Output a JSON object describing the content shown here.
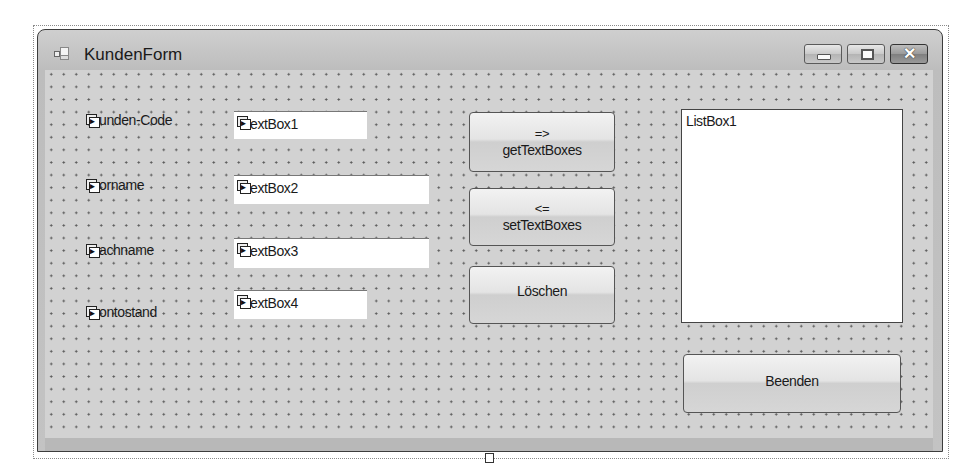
{
  "window": {
    "title": "KundenForm",
    "icon": "form-icon",
    "caption_buttons": [
      {
        "name": "minimize",
        "icon": "minimize-icon"
      },
      {
        "name": "maximize",
        "icon": "maximize-icon",
        "glyph": "□"
      },
      {
        "name": "close",
        "icon": "close-icon",
        "glyph": "✕"
      }
    ]
  },
  "labels": [
    {
      "text": "unden-Code",
      "full": "Kunden-Code"
    },
    {
      "text": "orname",
      "full": "Vorname"
    },
    {
      "text": "achname",
      "full": "Nachname"
    },
    {
      "text": "ontostand",
      "full": "Kontostand"
    }
  ],
  "textboxes": [
    {
      "text": "extBox1",
      "full": "TextBox1"
    },
    {
      "text": "extBox2",
      "full": "TextBox2"
    },
    {
      "text": "extBox3",
      "full": "TextBox3"
    },
    {
      "text": "extBox4",
      "full": "TextBox4"
    }
  ],
  "buttons": {
    "get": {
      "line1": "=>",
      "line2": "getTextBoxes"
    },
    "set": {
      "line1": "<=",
      "line2": "setTextBoxes"
    },
    "clear": {
      "label": "Löschen"
    },
    "exit": {
      "label": "Beenden"
    }
  },
  "listbox": {
    "items": [
      "ListBox1"
    ]
  }
}
